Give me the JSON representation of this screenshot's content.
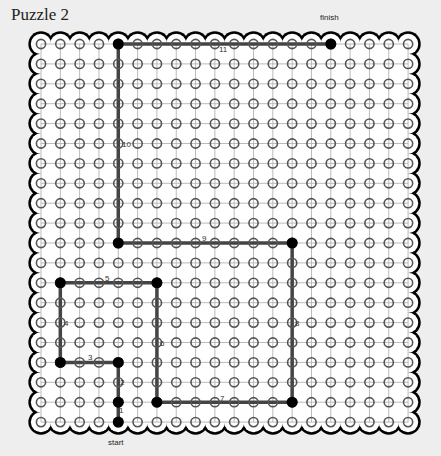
{
  "title": "Puzzle 2",
  "labels": {
    "start": "start",
    "finish": "finish"
  },
  "grid": {
    "cols": 20,
    "rows": 20,
    "origin_x": 41,
    "origin_y": 44,
    "step_x": 19.32,
    "step_y": 19.9
  },
  "colors": {
    "background": "#eeeeee",
    "board": "#ffffff",
    "border": "#000000",
    "grid_line": "#bbbbbb",
    "dot_ring": "#555555",
    "path": "#444444",
    "vertex": "#000000"
  },
  "path": {
    "vertices": [
      [
        4,
        19
      ],
      [
        4,
        18
      ],
      [
        4,
        16
      ],
      [
        1,
        16
      ],
      [
        1,
        12
      ],
      [
        6,
        12
      ],
      [
        6,
        18
      ],
      [
        13,
        18
      ],
      [
        13,
        10
      ],
      [
        4,
        10
      ],
      [
        4,
        0
      ],
      [
        15,
        0
      ]
    ],
    "segment_labels": [
      {
        "text": "1",
        "x": 119,
        "y": 413
      },
      {
        "text": "2",
        "x": 120,
        "y": 385
      },
      {
        "text": "3",
        "x": 88,
        "y": 360
      },
      {
        "text": "4",
        "x": 64,
        "y": 326
      },
      {
        "text": "5",
        "x": 105,
        "y": 281
      },
      {
        "text": "6",
        "x": 160,
        "y": 346
      },
      {
        "text": "7",
        "x": 220,
        "y": 401
      },
      {
        "text": "8",
        "x": 295,
        "y": 326
      },
      {
        "text": "9",
        "x": 202,
        "y": 241
      },
      {
        "text": "10",
        "x": 122,
        "y": 147
      },
      {
        "text": "11",
        "x": 219,
        "y": 52
      }
    ]
  }
}
